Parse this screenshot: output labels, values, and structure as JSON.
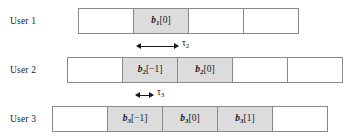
{
  "figure": {
    "type": "timing-diagram"
  },
  "rows": [
    {
      "label": "User 1",
      "label_x": 10,
      "label_y": 16,
      "x": 78,
      "y": 8,
      "cells": [
        {
          "shaded": false,
          "width": 56,
          "text": ""
        },
        {
          "shaded": true,
          "width": 56,
          "text": "b1[0]",
          "base": "b",
          "sub": "1",
          "index": "[0]"
        },
        {
          "shaded": false,
          "width": 56,
          "text": ""
        },
        {
          "shaded": false,
          "width": 56,
          "text": ""
        }
      ]
    },
    {
      "label": "User 2",
      "label_x": 10,
      "label_y": 65,
      "x": 67,
      "y": 57,
      "cells": [
        {
          "shaded": false,
          "width": 56,
          "text": ""
        },
        {
          "shaded": true,
          "width": 56,
          "text": "b2[-1]",
          "base": "b",
          "sub": "2",
          "index": "[−1]"
        },
        {
          "shaded": true,
          "width": 56,
          "text": "b2[0]",
          "base": "b",
          "sub": "2",
          "index": "[0]"
        },
        {
          "shaded": false,
          "width": 56,
          "text": ""
        },
        {
          "shaded": false,
          "width": 56,
          "text": ""
        }
      ]
    },
    {
      "label": "User 3",
      "label_x": 10,
      "label_y": 114,
      "x": 52,
      "y": 106,
      "cells": [
        {
          "shaded": false,
          "width": 56,
          "text": ""
        },
        {
          "shaded": true,
          "width": 56,
          "text": "b3[-1]",
          "base": "b",
          "sub": "3",
          "index": "[−1]"
        },
        {
          "shaded": true,
          "width": 56,
          "text": "b3[0]",
          "base": "b",
          "sub": "3",
          "index": "[0]"
        },
        {
          "shaded": true,
          "width": 56,
          "text": "b3[1]",
          "base": "b",
          "sub": "3",
          "index": "[1]"
        },
        {
          "shaded": false,
          "width": 56,
          "text": ""
        }
      ]
    }
  ],
  "annotations": [
    {
      "name": "tau-2",
      "symbol": "τ",
      "sub": "2",
      "x": 137,
      "y": 40,
      "length": 41,
      "label_offset": 45
    },
    {
      "name": "tau-3",
      "symbol": "τ",
      "sub": "3",
      "x": 136,
      "y": 89,
      "length": 17,
      "label_offset": 21
    }
  ],
  "colors": {
    "shaded_fill": "#dcdcdc",
    "cell_fill": "#ffffff",
    "border": "#8a8a8a",
    "text": "#1a1a1a",
    "background": "#ffffff"
  }
}
